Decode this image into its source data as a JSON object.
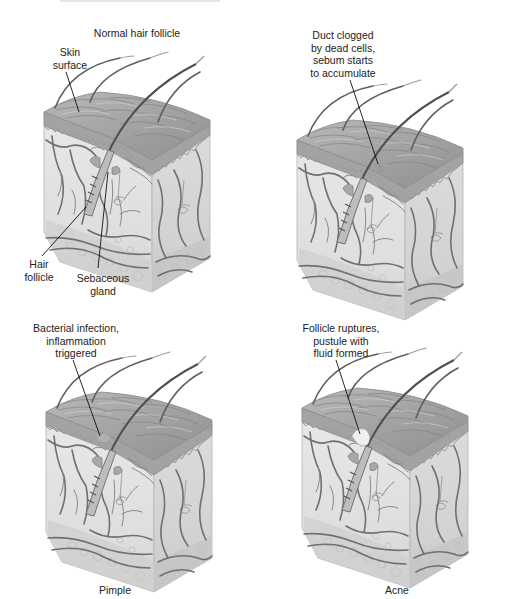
{
  "figure": {
    "title_top_left": "Normal hair follicle",
    "panels": [
      {
        "id": "normal",
        "heading": "Normal hair follicle",
        "caption": "",
        "labels": [
          {
            "text": "Skin\nsurface"
          },
          {
            "text": "Hair\nfollicle"
          },
          {
            "text": "Sebaceous\ngland"
          }
        ]
      },
      {
        "id": "clogged",
        "heading": "",
        "caption": "",
        "labels": [
          {
            "text": "Duct clogged\nby dead cells,\nsebum starts\nto accumulate"
          }
        ]
      },
      {
        "id": "pimple",
        "heading": "",
        "caption": "Pimple",
        "labels": [
          {
            "text": "Bacterial infection,\ninflammation\ntriggered"
          }
        ]
      },
      {
        "id": "acne",
        "heading": "",
        "caption": "Acne",
        "labels": [
          {
            "text": "Follicle ruptures,\npustule with\nfluid formed"
          }
        ]
      }
    ]
  },
  "colors": {
    "background": "#ffffff",
    "skin_top": "#a9a9a9",
    "epidermis": "#9c9c9c",
    "dermis": "#e4e4e4",
    "dermis_side": "#d6d6d6",
    "fat": "#d2d2d2",
    "vessel": "#6e6e6e",
    "hair": "#5a5a5a",
    "leader_line": "#111111",
    "text": "#222222"
  }
}
